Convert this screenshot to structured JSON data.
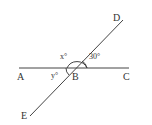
{
  "diagram": {
    "type": "intersecting-lines-angles",
    "points": {
      "A": "A",
      "B": "B",
      "C": "C",
      "D": "D",
      "E": "E"
    },
    "angles": {
      "x": "x°",
      "given": "30°",
      "y": "y°"
    },
    "lines": [
      "AC",
      "DE"
    ],
    "intersection": "B",
    "colors": {
      "stroke": "#444444",
      "background": "#ffffff"
    }
  }
}
